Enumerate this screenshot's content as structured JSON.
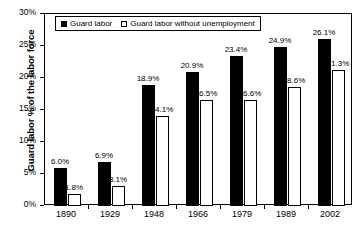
{
  "chart_data": {
    "type": "bar",
    "title": "",
    "xlabel": "",
    "ylabel": "Guard labor % of the labor force",
    "ylim": [
      0,
      30
    ],
    "yticks": [
      "0%",
      "5%",
      "10%",
      "15%",
      "20%",
      "25%",
      "30%"
    ],
    "ytick_values": [
      0,
      5,
      10,
      15,
      20,
      25,
      30
    ],
    "grid": false,
    "legend_position": "top-left-inside",
    "categories": [
      "1890",
      "1929",
      "1948",
      "1966",
      "1979",
      "1989",
      "2002"
    ],
    "series": [
      {
        "name": "Guard labor",
        "style": "solid",
        "color": "#000000",
        "values": [
          6.0,
          6.9,
          18.9,
          20.9,
          23.4,
          24.9,
          26.1
        ],
        "labels": [
          "6.0%",
          "6.9%",
          "18.9%",
          "20.9%",
          "23.4%",
          "24.9%",
          "26.1%"
        ]
      },
      {
        "name": "Guard labor without unemployment",
        "style": "hollow",
        "color": "#ffffff",
        "values": [
          1.8,
          3.1,
          14.1,
          16.5,
          16.6,
          18.6,
          21.3
        ],
        "labels": [
          "1.8%",
          "3.1%",
          "14.1%",
          "16.5%",
          "16.6%",
          "18.6%",
          "21.3%"
        ]
      }
    ]
  },
  "colors": {
    "axis": "#000000",
    "background": "#ffffff",
    "series_solid": "#000000",
    "series_hollow": "#ffffff"
  }
}
